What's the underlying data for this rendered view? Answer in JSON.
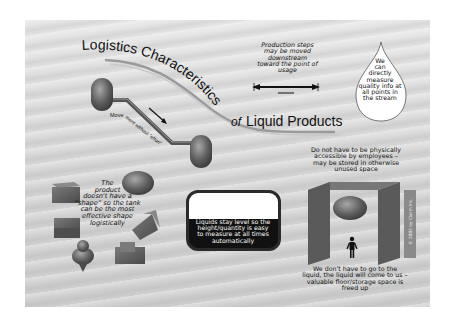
{
  "title": {
    "part1": "Logistics Characteristics",
    "part2": "of",
    "part3": "Liquid Products"
  },
  "pipeline": {
    "label": "Movement without \"effort\""
  },
  "production_steps": {
    "lines": [
      "Production steps",
      "may be moved",
      "downstream",
      "toward the point of",
      "usage"
    ]
  },
  "drop": {
    "lines": [
      "We",
      "can",
      "directly",
      "measure",
      "quality info at",
      "all points in",
      "the stream"
    ]
  },
  "shape": {
    "lines": [
      "The",
      "product",
      "doesn't have a",
      "“shape” so the tank",
      "can be the most",
      "effective shape",
      "logistically"
    ]
  },
  "level": {
    "lines": [
      "Liquids stay level so the",
      "height/quantity is easy",
      "to measure at all times",
      "automatically"
    ]
  },
  "access": {
    "lines": [
      "Do not have to be physically",
      "accessible by employees –",
      "may be stored in otherwise",
      "unused space"
    ]
  },
  "come": {
    "lines": [
      "We don't have to go to the",
      "liquid, the liquid will come to us –",
      "valuable floor/storage space is",
      "freed up"
    ]
  },
  "copyright": "© 2005 by Clarm Inc.",
  "colors": {
    "background": "#d8d8d8",
    "tank": "#6a6a6a",
    "text": "#111111"
  }
}
